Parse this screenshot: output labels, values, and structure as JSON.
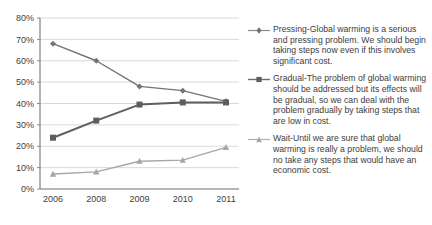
{
  "chart_data": {
    "type": "line",
    "title": "",
    "xlabel": "",
    "ylabel": "",
    "categories": [
      "2006",
      "2008",
      "2009",
      "2010",
      "2011"
    ],
    "ylim": [
      0,
      80
    ],
    "ytick_labels": [
      "0%",
      "10%",
      "20%",
      "30%",
      "40%",
      "50%",
      "60%",
      "70%",
      "80%"
    ],
    "ytick_values": [
      0,
      10,
      20,
      30,
      40,
      50,
      60,
      70,
      80
    ],
    "grid": true,
    "grid_axis": "y",
    "legend_position": "right",
    "series": [
      {
        "name": "Pressing",
        "label": "Pressing-Global warming is a serious and pressing problem. We should begin taking steps now even if this involves significant cost.",
        "marker": "diamond",
        "color": "#737373",
        "values": [
          68,
          60,
          48,
          46,
          41
        ]
      },
      {
        "name": "Gradual",
        "label": "Gradual-The problem of global warming should be addressed but its effects will be gradual, so we can deal with the problem gradually by taking steps that are low in cost.",
        "marker": "square",
        "color": "#5e5e5e",
        "values": [
          24,
          32,
          39.5,
          40.5,
          40.5
        ]
      },
      {
        "name": "Wait",
        "label": "Wait-Until we are sure that global warming is really a problem, we should no take any steps that would have an economic cost.",
        "marker": "triangle",
        "color": "#a6a6a6",
        "values": [
          7,
          8,
          13,
          13.5,
          19.5
        ]
      }
    ]
  },
  "colors": {
    "axis": "#808080",
    "grid": "#cfcfcf",
    "text": "#3d3d3d",
    "background": "#ffffff"
  }
}
